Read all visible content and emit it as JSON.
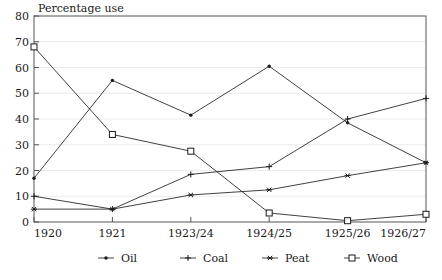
{
  "chart_data": {
    "type": "line",
    "title": "Percentage use",
    "xlabel": "",
    "ylabel": "",
    "ylim": [
      0,
      80
    ],
    "yticks": [
      0,
      10,
      20,
      30,
      40,
      50,
      60,
      70,
      80
    ],
    "grid": true,
    "legend_position": "bottom",
    "categories": [
      "1920",
      "1921",
      "1923/24",
      "1924/25",
      "1925/26",
      "1926/27"
    ],
    "series": [
      {
        "name": "Oil",
        "marker": "dot",
        "values": [
          17,
          55,
          41.5,
          60.5,
          38.5,
          23
        ]
      },
      {
        "name": "Coal",
        "marker": "plus",
        "values": [
          10,
          5,
          18.5,
          21.5,
          40,
          48
        ]
      },
      {
        "name": "Peat",
        "marker": "asterisk",
        "values": [
          5,
          5,
          10.5,
          12.5,
          18,
          23
        ]
      },
      {
        "name": "Wood",
        "marker": "square",
        "values": [
          68,
          34,
          27.5,
          3.5,
          0.5,
          3
        ]
      }
    ]
  },
  "axis": {
    "y_tick_labels": [
      "0",
      "10",
      "20",
      "30",
      "40",
      "50",
      "60",
      "70",
      "80"
    ],
    "x_tick_labels": [
      "1920",
      "1921",
      "1923/24",
      "1924/25",
      "1925/26",
      "1926/27"
    ]
  },
  "legend": {
    "entries": [
      {
        "label": "Oil",
        "marker": "dot"
      },
      {
        "label": "Coal",
        "marker": "plus"
      },
      {
        "label": "Peat",
        "marker": "asterisk"
      },
      {
        "label": "Wood",
        "marker": "square"
      }
    ]
  },
  "colors": {
    "line": "#2b2b2b",
    "frame": "#555555",
    "grid": "#e2e2e2",
    "text": "#1a1a1a",
    "background": "#ffffff"
  }
}
